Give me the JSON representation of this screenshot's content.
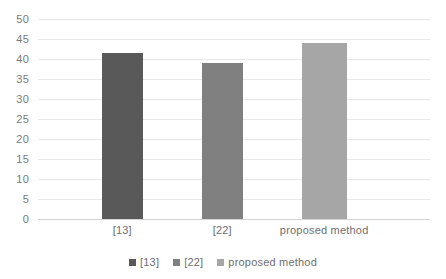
{
  "chart_data": {
    "type": "bar",
    "title": "",
    "xlabel": "",
    "ylabel": "",
    "categories": [
      "[13]",
      "[22]",
      "proposed method"
    ],
    "values": [
      41.5,
      39,
      44
    ],
    "series": [
      {
        "name": "[13]",
        "values": [
          41.5,
          null,
          null
        ],
        "color": "#595959"
      },
      {
        "name": "[22]",
        "values": [
          null,
          39,
          null
        ],
        "color": "#808080"
      },
      {
        "name": "proposed method",
        "values": [
          null,
          null,
          44
        ],
        "color": "#a6a6a6"
      }
    ],
    "ylim": [
      0,
      50
    ],
    "ytick_step": 5,
    "yticks": [
      "50",
      "45",
      "40",
      "35",
      "30",
      "25",
      "20",
      "15",
      "10",
      "5",
      "0"
    ],
    "ytick_values": [
      50,
      45,
      40,
      35,
      30,
      25,
      20,
      15,
      10,
      5,
      0
    ],
    "grid": true,
    "grid_axis": "y",
    "legend_position": "bottom",
    "legend": [
      {
        "label": "[13]",
        "color": "#595959"
      },
      {
        "label": "[22]",
        "color": "#808080"
      },
      {
        "label": "proposed method",
        "color": "#a6a6a6"
      }
    ],
    "bars": [
      {
        "category": "[13]",
        "value": 41.5,
        "color": "#595959",
        "center_pct": 21.5,
        "width_pct": 10.5
      },
      {
        "category": "[22]",
        "value": 39,
        "color": "#808080",
        "center_pct": 47.0,
        "width_pct": 10.5
      },
      {
        "category": "proposed method",
        "value": 44,
        "color": "#a6a6a6",
        "center_pct": 73.0,
        "width_pct": 11.5
      }
    ],
    "colors": {
      "gridline": "#e8e8e8",
      "baseline": "#d4d4d4",
      "tick_text": "#7a7a7a",
      "background": "#ffffff"
    }
  }
}
